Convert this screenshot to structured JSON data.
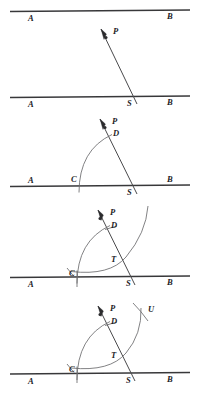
{
  "figure": {
    "type": "geometric-construction",
    "panel_count": 4,
    "colors": {
      "baseline": "#38383a",
      "transversal": "#4a4a4c",
      "arc": "#6b6b6e",
      "label": "#1d1d1f",
      "background": "#ffffff"
    },
    "panels": [
      {
        "id": "panel-1",
        "step": 1,
        "caption": "Given line AB and point P; draw a transversal through P meeting AB at S.",
        "labels": {
          "top_left": "A",
          "top_right": "B",
          "bottom_left": "A",
          "bottom_right": "B",
          "point_p": "P",
          "point_s": "S"
        },
        "label_list": [
          "A",
          "B",
          "A",
          "B",
          "P",
          "S"
        ]
      },
      {
        "id": "panel-2",
        "step": 2,
        "caption": "With S as centre, draw an arc cutting SA at C and the transversal at D.",
        "labels": {
          "left": "A",
          "right": "B",
          "point_p": "P",
          "point_d": "D",
          "point_c": "C",
          "point_s": "S"
        },
        "label_list": [
          "A",
          "B",
          "P",
          "D",
          "C",
          "S"
        ]
      },
      {
        "id": "panel-3",
        "step": 3,
        "caption": "With C as centre and the same radius, draw an arc cutting the transversal at T.",
        "labels": {
          "left": "A",
          "right": "B",
          "point_p": "P",
          "point_d": "D",
          "point_c": "C",
          "point_t": "T",
          "point_s": "S"
        },
        "label_list": [
          "A",
          "B",
          "P",
          "D",
          "C",
          "T",
          "S"
        ]
      },
      {
        "id": "panel-4",
        "step": 4,
        "caption": "Cut off an arc equal to CD from T to locate U; PU is parallel to AB.",
        "labels": {
          "left": "A",
          "right": "B",
          "point_p": "P",
          "point_d": "D",
          "point_u": "U",
          "point_c": "C",
          "point_t": "T",
          "point_s": "S"
        },
        "label_list": [
          "A",
          "B",
          "P",
          "D",
          "U",
          "C",
          "T",
          "S"
        ]
      }
    ]
  }
}
